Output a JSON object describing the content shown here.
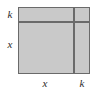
{
  "figure": {
    "kind": "area-model-diagram",
    "colors": {
      "fill": "#c9c9c9",
      "stroke": "#6a6a6a",
      "label": "#2b2b2b",
      "background": "#ffffff"
    }
  },
  "labels": {
    "left_top": "k",
    "left_bottom": "x",
    "bottom_left": "x",
    "bottom_right": "k"
  },
  "chart_data": {
    "type": "area-model",
    "title": "",
    "xlabel": "",
    "ylabel": "",
    "column_labels": [
      "x",
      "k"
    ],
    "row_labels": [
      "k",
      "x"
    ],
    "column_widths": [
      55,
      17
    ],
    "row_heights": [
      14,
      52
    ],
    "regions": [
      {
        "row": "k",
        "column": "x",
        "area": "x·k"
      },
      {
        "row": "k",
        "column": "k",
        "area": "k·k"
      },
      {
        "row": "x",
        "column": "x",
        "area": "x·x"
      },
      {
        "row": "x",
        "column": "k",
        "area": "x·k"
      }
    ],
    "grid": true,
    "legend": "none"
  }
}
